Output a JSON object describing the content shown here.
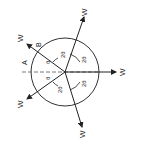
{
  "diagram": {
    "type": "force-diagram",
    "rotation_deg": -90,
    "circle": {
      "cx": 65,
      "cy": 72,
      "r": 34
    },
    "labels": {
      "point_a": "A",
      "point_b": "B",
      "theta": "θ",
      "two_theta": "2θ",
      "force": "W"
    },
    "forces": [
      {
        "id": "w1",
        "label": "W",
        "x2": 128,
        "y2": 72,
        "lx": 127,
        "ly": 71
      },
      {
        "id": "w2",
        "label": "W",
        "x2": 84,
        "y2": 16,
        "lx": 85,
        "ly": 12
      },
      {
        "id": "w3",
        "label": "W",
        "x2": 26,
        "y2": 44,
        "lx": 20,
        "ly": 38
      },
      {
        "id": "w4",
        "label": "W",
        "x2": 26,
        "y2": 98,
        "lx": 20,
        "ly": 104
      },
      {
        "id": "w5",
        "label": "W",
        "x2": 82,
        "y2": 128,
        "lx": 82,
        "ly": 134
      }
    ],
    "angle_labels": [
      {
        "text": "2θ",
        "x": 63,
        "y": 55
      },
      {
        "text": "2θ",
        "x": 84,
        "y": 60
      },
      {
        "text": "2θ",
        "x": 84,
        "y": 84
      },
      {
        "text": "2θ",
        "x": 60,
        "y": 90
      },
      {
        "text": "θ",
        "x": 48,
        "y": 62
      },
      {
        "text": "θ",
        "x": 48,
        "y": 78
      }
    ]
  }
}
